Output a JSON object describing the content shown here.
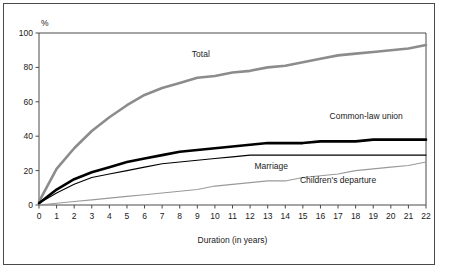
{
  "figure": {
    "percent_symbol": "%",
    "footnote": ""
  },
  "chart_data": {
    "type": "line",
    "title": "",
    "subtitle": "",
    "xlabel": "Duration (in years)",
    "ylabel": "%",
    "xlim": [
      0,
      22
    ],
    "ylim": [
      0,
      100
    ],
    "grid": false,
    "legend_position": "inline-annotations",
    "xticks": [
      0,
      1,
      2,
      3,
      4,
      5,
      6,
      7,
      8,
      9,
      10,
      11,
      12,
      13,
      14,
      15,
      16,
      17,
      18,
      19,
      20,
      21,
      22
    ],
    "xtick_labels": [
      "0",
      "1",
      "2",
      "3",
      "4",
      "5",
      "6",
      "7",
      "8",
      "9",
      "10",
      "11",
      "12",
      "13",
      "14",
      "15",
      "16",
      "17",
      "18",
      "19",
      "20",
      "21",
      "22"
    ],
    "yticks": [
      0,
      20,
      40,
      60,
      80,
      100
    ],
    "ytick_labels": [
      "0",
      "20",
      "40",
      "60",
      "80",
      "100"
    ],
    "x": [
      0,
      1,
      2,
      3,
      4,
      5,
      6,
      7,
      8,
      9,
      10,
      11,
      12,
      13,
      14,
      15,
      16,
      17,
      18,
      19,
      20,
      21,
      22
    ],
    "series": [
      {
        "name": "Total",
        "label": "Total",
        "color": "#8c8c8c",
        "width": 2.6,
        "values": [
          2,
          21,
          33,
          43,
          51,
          58,
          64,
          68,
          71,
          74,
          75,
          77,
          78,
          80,
          81,
          83,
          85,
          87,
          88,
          89,
          90,
          91,
          93
        ]
      },
      {
        "name": "Common-law union",
        "label": "Common-law union",
        "color": "#000000",
        "width": 2.6,
        "values": [
          1,
          9,
          15,
          19,
          22,
          25,
          27,
          29,
          31,
          32,
          33,
          34,
          35,
          36,
          36,
          36,
          37,
          37,
          37,
          38,
          38,
          38,
          38
        ]
      },
      {
        "name": "Marriage",
        "label": "Marriage",
        "color": "#000000",
        "width": 1.1,
        "values": [
          1,
          7,
          12,
          16,
          18,
          20,
          22,
          24,
          25,
          26,
          27,
          28,
          29,
          29,
          29,
          29,
          29,
          29,
          29,
          29,
          29,
          29,
          29
        ]
      },
      {
        "name": "Children's departure",
        "label": "Children's departure",
        "color": "#9a9a9a",
        "width": 1.1,
        "values": [
          0,
          1,
          2,
          3,
          4,
          5,
          6,
          7,
          8,
          9,
          11,
          12,
          13,
          14,
          14,
          16,
          17,
          18,
          20,
          21,
          22,
          23,
          25
        ]
      }
    ],
    "annotations": [
      {
        "text": "Total",
        "x": 9.2,
        "y": 86,
        "series": "Total"
      },
      {
        "text": "Common-law union",
        "x": 18.6,
        "y": 50,
        "series": "Common-law union"
      },
      {
        "text": "Marriage",
        "x": 13.2,
        "y": 21,
        "series": "Marriage"
      },
      {
        "text": "Children's departure",
        "x": 17.0,
        "y": 13,
        "series": "Children's departure"
      }
    ]
  }
}
